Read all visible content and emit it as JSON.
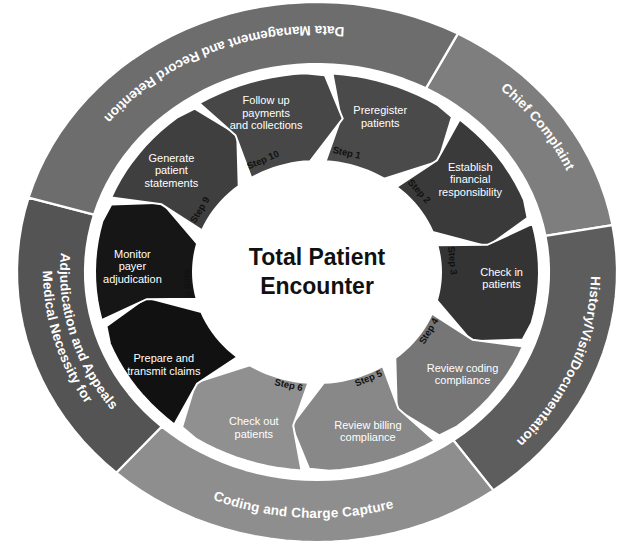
{
  "diagram": {
    "title": "Total Patient Encounter",
    "center_line_1": "Total Patient",
    "center_line_2": "Encounter",
    "background_color": "#ffffff",
    "outline_color": "#ffffff",
    "outer_ring": [
      {
        "id": "chief-complaint",
        "label": "Chief Complaint",
        "label_lines": [
          "Chief Complaint"
        ],
        "color": "#7e7e7e",
        "start_angle": -62,
        "end_angle": -10
      },
      {
        "id": "history-visit-documentation",
        "label": "History/Visit/Documentation",
        "label_lines": [
          "History/Visit/Documentation"
        ],
        "color": "#5d5d5d",
        "start_angle": -10,
        "end_angle": 54
      },
      {
        "id": "coding-and-charge-capture",
        "label": "Coding and Charge Capture",
        "label_lines": [
          "Coding and Charge Capture"
        ],
        "color": "#8e8e8e",
        "start_angle": 54,
        "end_angle": 132
      },
      {
        "id": "medical-necessity-adjudication-appeals",
        "label": "Medical Necessity for Adjudication and Appeals",
        "label_lines": [
          "Medical Necessity for",
          "Adjudication and Appeals"
        ],
        "color": "#545454",
        "start_angle": 132,
        "end_angle": 196
      },
      {
        "id": "data-management-record-retention",
        "label": "Data Management and Record Retention",
        "label_lines": [
          "Data Management and Record Retention"
        ],
        "color": "#6d6d6d",
        "start_angle": 196,
        "end_angle": 298
      }
    ],
    "steps": [
      {
        "step_label": "Step 1",
        "task_lines": [
          "Preregister",
          "patients"
        ],
        "task": "Preregister patients",
        "color": "#4a4a4a",
        "text_color": "#ffffff"
      },
      {
        "step_label": "Step 2",
        "task_lines": [
          "Establish",
          "financial",
          "responsibility"
        ],
        "task": "Establish financial responsibility",
        "color": "#3a3a3a",
        "text_color": "#ffffff"
      },
      {
        "step_label": "Step 3",
        "task_lines": [
          "Check in",
          "patients"
        ],
        "task": "Check in patients",
        "color": "#343434",
        "text_color": "#ffffff"
      },
      {
        "step_label": "Step 4",
        "task_lines": [
          "Review coding",
          "compliance"
        ],
        "task": "Review coding compliance",
        "color": "#767676",
        "text_color": "#ffffff"
      },
      {
        "step_label": "Step 5",
        "task_lines": [
          "Review billing",
          "compliance"
        ],
        "task": "Review billing compliance",
        "color": "#888888",
        "text_color": "#ffffff"
      },
      {
        "step_label": "Step 6",
        "task_lines": [
          "Check out",
          "patients"
        ],
        "task": "Check out patients",
        "color": "#909090",
        "text_color": "#ffffff"
      },
      {
        "step_label": "Step 7",
        "task_lines": [
          "Prepare and",
          "transmit claims"
        ],
        "task": "Prepare and transmit claims",
        "color": "#111111",
        "text_color": "#ffffff"
      },
      {
        "step_label": "Step 8",
        "task_lines": [
          "Monitor",
          "payer",
          "adjudication"
        ],
        "task": "Monitor payer adjudication",
        "color": "#161616",
        "text_color": "#ffffff"
      },
      {
        "step_label": "Step 9",
        "task_lines": [
          "Generate",
          "patient",
          "statements"
        ],
        "task": "Generate patient statements",
        "color": "#3f3f3f",
        "text_color": "#ffffff"
      },
      {
        "step_label": "Step 10",
        "task_lines": [
          "Follow up",
          "payments",
          "and collections"
        ],
        "task": "Follow up payments and collections",
        "color": "#474747",
        "text_color": "#ffffff"
      }
    ]
  }
}
